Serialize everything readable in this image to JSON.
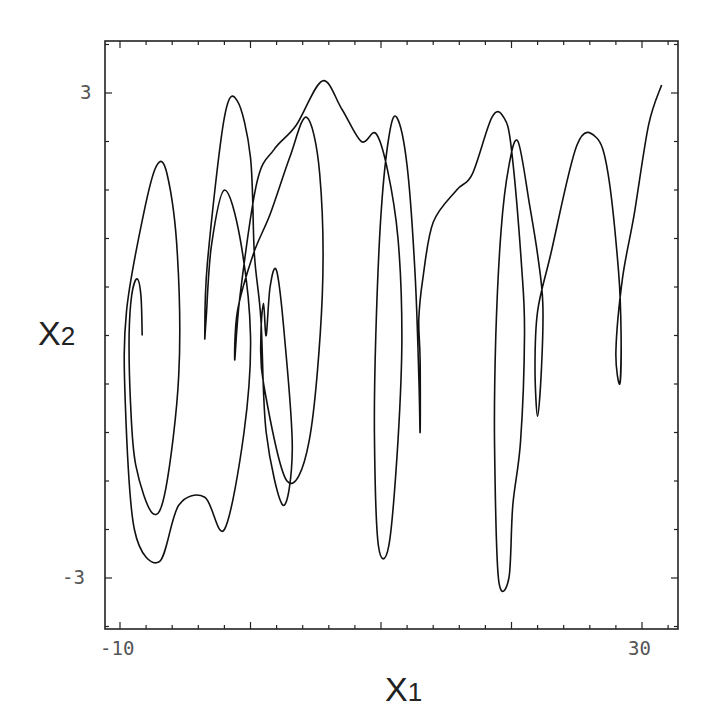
{
  "chart_data": {
    "type": "line",
    "title": "",
    "xlabel": "X1",
    "ylabel": "X2",
    "xlabel_main": "X",
    "xlabel_sub": "1",
    "ylabel_main": "X",
    "ylabel_sub": "2",
    "xlim": [
      -11.2,
      32.8
    ],
    "ylim": [
      -3.6,
      3.65
    ],
    "x_ticks": [
      {
        "value": -10,
        "label": "-10"
      },
      {
        "value": 30,
        "label": "30"
      }
    ],
    "y_ticks": [
      {
        "value": 3,
        "label": "3"
      },
      {
        "value": -3,
        "label": "-3"
      }
    ],
    "minor_tick_step_x": 2,
    "minor_tick_step_y": 0.6,
    "grid": false,
    "legend": null,
    "line_color": "#111111",
    "series": [
      {
        "name": "trajectory",
        "points": [
          [
            -8.3,
            0.0
          ],
          [
            -8.4,
            0.5
          ],
          [
            -8.7,
            0.7
          ],
          [
            -9.1,
            0.5
          ],
          [
            -9.3,
            0.0
          ],
          [
            -9.2,
            -0.8
          ],
          [
            -8.8,
            -1.6
          ],
          [
            -7.5,
            -2.2
          ],
          [
            -6.5,
            -1.9
          ],
          [
            -5.5,
            -0.5
          ],
          [
            -5.6,
            1.0
          ],
          [
            -6.4,
            2.0
          ],
          [
            -7.2,
            2.1
          ],
          [
            -8.2,
            1.5
          ],
          [
            -9.5,
            0.3
          ],
          [
            -9.6,
            -0.8
          ],
          [
            -8.9,
            -2.4
          ],
          [
            -7.0,
            -2.8
          ],
          [
            -5.5,
            -2.1
          ],
          [
            -3.5,
            -2.0
          ],
          [
            -2.0,
            -2.4
          ],
          [
            -0.5,
            -1.2
          ],
          [
            0.0,
            0.0
          ],
          [
            -0.8,
            1.2
          ],
          [
            -2.0,
            1.8
          ],
          [
            -3.0,
            1.1
          ],
          [
            -3.4,
            0.2
          ],
          [
            -3.5,
            0.0
          ],
          [
            -3.3,
            0.9
          ],
          [
            -2.0,
            2.7
          ],
          [
            -1.0,
            2.9
          ],
          [
            0.0,
            2.2
          ],
          [
            0.3,
            1.0
          ],
          [
            0.8,
            0.2
          ],
          [
            1.2,
            -1.2
          ],
          [
            2.5,
            -2.1
          ],
          [
            3.2,
            -1.4
          ],
          [
            2.6,
            0.0
          ],
          [
            2.0,
            0.8
          ],
          [
            1.5,
            0.6
          ],
          [
            1.2,
            0.0
          ],
          [
            1.0,
            0.4
          ],
          [
            0.8,
            0.0
          ],
          [
            1.0,
            -0.6
          ],
          [
            2.8,
            -1.8
          ],
          [
            4.5,
            -1.3
          ],
          [
            5.5,
            0.5
          ],
          [
            5.3,
            2.0
          ],
          [
            4.3,
            2.7
          ],
          [
            3.0,
            2.2
          ],
          [
            1.5,
            1.5
          ],
          [
            0.2,
            1.0
          ],
          [
            -1.0,
            0.3
          ],
          [
            -1.2,
            -0.3
          ],
          [
            -0.8,
            0.5
          ],
          [
            0.5,
            1.9
          ],
          [
            1.8,
            2.3
          ],
          [
            3.5,
            2.6
          ],
          [
            5.5,
            3.15
          ],
          [
            7.0,
            2.8
          ],
          [
            8.5,
            2.4
          ],
          [
            9.6,
            2.5
          ],
          [
            10.5,
            2.05
          ],
          [
            11.3,
            1.2
          ],
          [
            11.6,
            0.0
          ],
          [
            11.3,
            -1.3
          ],
          [
            10.6,
            -2.6
          ],
          [
            9.8,
            -2.6
          ],
          [
            9.5,
            -1.3
          ],
          [
            9.6,
            0.0
          ],
          [
            10.0,
            1.5
          ],
          [
            10.6,
            2.45
          ],
          [
            11.2,
            2.7
          ],
          [
            12.0,
            2.1
          ],
          [
            12.6,
            0.8
          ],
          [
            12.9,
            -0.5
          ],
          [
            13.0,
            -1.2
          ],
          [
            13.0,
            -0.3
          ],
          [
            12.9,
            0.2
          ],
          [
            13.2,
            0.7
          ],
          [
            14.0,
            1.4
          ],
          [
            15.8,
            1.8
          ],
          [
            17.0,
            2.0
          ],
          [
            18.5,
            2.7
          ],
          [
            19.4,
            2.7
          ],
          [
            20.0,
            2.3
          ],
          [
            20.8,
            0.8
          ],
          [
            21.0,
            0.0
          ],
          [
            20.7,
            -1.3
          ],
          [
            20.1,
            -2.1
          ],
          [
            19.8,
            -3.0
          ],
          [
            19.0,
            -3.0
          ],
          [
            18.7,
            -1.3
          ],
          [
            18.8,
            0.0
          ],
          [
            19.2,
            1.3
          ],
          [
            19.8,
            2.1
          ],
          [
            20.5,
            2.4
          ],
          [
            21.4,
            1.6
          ],
          [
            22.0,
            1.0
          ],
          [
            22.4,
            0.4
          ],
          [
            22.3,
            -0.4
          ],
          [
            22.0,
            -1.0
          ],
          [
            21.8,
            -0.4
          ],
          [
            22.0,
            0.3
          ],
          [
            23.0,
            1.0
          ],
          [
            25.0,
            2.35
          ],
          [
            26.5,
            2.45
          ],
          [
            27.4,
            2.0
          ],
          [
            28.2,
            0.8
          ],
          [
            28.4,
            0.0
          ],
          [
            28.3,
            -0.6
          ],
          [
            28.0,
            -0.2
          ],
          [
            28.5,
            0.7
          ],
          [
            29.4,
            1.5
          ],
          [
            30.5,
            2.6
          ],
          [
            31.5,
            3.1
          ]
        ]
      }
    ]
  }
}
